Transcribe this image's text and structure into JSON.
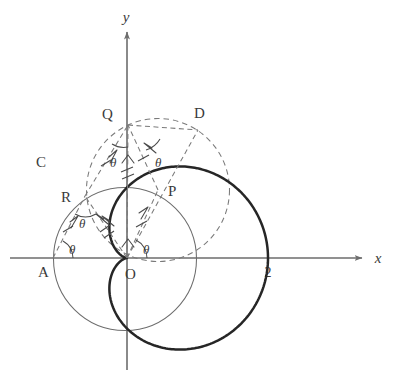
{
  "figure": {
    "type": "polar-geometry-diagram",
    "width": 400,
    "height": 382,
    "background": "#ffffff",
    "ink": "#3a3a3a",
    "ink_light": "#6d6d6d"
  },
  "axes": {
    "x_label": "x",
    "y_label": "y",
    "origin_label": "O",
    "origin_px": {
      "x": 127,
      "y": 258
    },
    "unit_px": 70.5,
    "x_axis": {
      "x1": 10,
      "x2": 368,
      "y": 258
    },
    "y_axis": {
      "x": 127,
      "y1": 370,
      "y2": 26
    },
    "ticks": [
      {
        "label": "2",
        "value": 2,
        "x_px": 268,
        "y_px": 258
      }
    ]
  },
  "points": [
    {
      "name": "A",
      "label": "A",
      "x_px": 53,
      "y_px": 258,
      "label_x": 38,
      "label_y": 276,
      "polar": "r=0 at theta=pi"
    },
    {
      "name": "O",
      "label": "O",
      "x_px": 127,
      "y_px": 258,
      "label_x": 129,
      "label_y": 277,
      "polar": "origin"
    },
    {
      "name": "P",
      "label": "P",
      "x_px": 158,
      "y_px": 190,
      "label_x": 168,
      "label_y": 192,
      "polar": "on unit circle"
    },
    {
      "name": "Q",
      "label": "Q",
      "x_px": 128,
      "y_px": 125,
      "label_x": 104,
      "label_y": 115,
      "polar": "apex of cardioid"
    },
    {
      "name": "R",
      "label": "R",
      "x_px": 85,
      "y_px": 196,
      "label_x": 62,
      "label_y": 196,
      "polar": "on unit circle"
    },
    {
      "name": "C",
      "label": "C",
      "x_px": 42,
      "y_px": 160,
      "label_x": 38,
      "label_y": 164,
      "polar": "on cardioid"
    },
    {
      "name": "D",
      "label": "D",
      "x_px": 198,
      "y_px": 130,
      "label_x": 196,
      "label_y": 115,
      "polar": "on dashed circle"
    }
  ],
  "angle_labels": [
    {
      "id": "theta-at-A",
      "text": "θ",
      "x": 72,
      "y": 252
    },
    {
      "id": "theta-at-O-left",
      "text": "θ",
      "x": 144,
      "y": 252
    },
    {
      "id": "theta-at-R",
      "text": "θ",
      "x": 83,
      "y": 224
    },
    {
      "id": "theta-at-Q-left",
      "text": "θ",
      "x": 113,
      "y": 164
    },
    {
      "id": "theta-at-Q-right",
      "text": "θ",
      "x": 158,
      "y": 164
    }
  ],
  "curves": {
    "cardioid": {
      "name": "cardioid-curve",
      "style": "solid-thick",
      "equation": "r = 1 + cos(theta)"
    },
    "unit_circle": {
      "name": "unit-circle",
      "style": "solid-thin",
      "equation": "x^2 + y^2 = 1"
    },
    "dashed_circle": {
      "name": "dashed-circle",
      "style": "dashed-thin",
      "equation": "circle through O, Q, D centred at P"
    }
  },
  "construction_lines": [
    {
      "name": "segment-A-R",
      "from": "A",
      "to": "R",
      "style": "dashed",
      "ticks": 1
    },
    {
      "name": "segment-R-Q",
      "from": "R",
      "to": "Q",
      "style": "dashed",
      "ticks": 1
    },
    {
      "name": "segment-O-R",
      "from": "O",
      "to": "R",
      "style": "dashed",
      "ticks": 2
    },
    {
      "name": "segment-O-P",
      "from": "O",
      "to": "P",
      "style": "dashed",
      "ticks": 1
    },
    {
      "name": "segment-P-Q",
      "from": "P",
      "to": "Q",
      "style": "dashed",
      "ticks": 1
    },
    {
      "name": "segment-O-Q",
      "from": "O",
      "to": "Q",
      "style": "dashed",
      "ticks": 2
    },
    {
      "name": "segment-Q-D",
      "from": "Q",
      "to": "D",
      "style": "dashed",
      "ticks": 0
    },
    {
      "name": "segment-O-D",
      "from": "O",
      "to": "D",
      "style": "dashed",
      "ticks": 0
    }
  ]
}
